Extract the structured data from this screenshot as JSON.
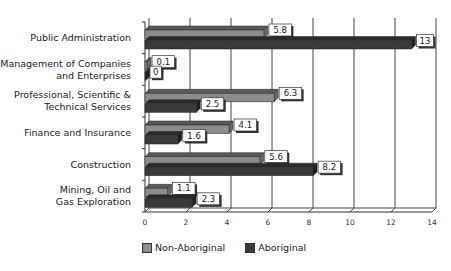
{
  "chart_data": {
    "type": "bar",
    "orientation": "horizontal",
    "style": "3d",
    "title": "",
    "xlabel": "",
    "ylabel": "",
    "xlim": [
      0,
      14
    ],
    "x_ticks": [
      0,
      2,
      4,
      6,
      8,
      10,
      12,
      14
    ],
    "grid": true,
    "legend_position": "bottom",
    "categories": [
      "Public Administration",
      "Management of Companies\nand Enterprises",
      "Professional, Scientific &\nTechnical Services",
      "Finance and Insurance",
      "Construction",
      "Mining, Oil and\nGas Exploration"
    ],
    "series": [
      {
        "name": "Non-Aboriginal",
        "color": "#8c8c8c",
        "values": [
          5.8,
          0.1,
          6.3,
          4.1,
          5.6,
          1.1
        ]
      },
      {
        "name": "Aboriginal",
        "color": "#3a3a3a",
        "values": [
          13,
          0,
          2.5,
          1.6,
          8.2,
          2.3
        ]
      }
    ],
    "data_labels": [
      [
        "5.8",
        "0.1",
        "6.3",
        "4.1",
        "5.6",
        "1.1"
      ],
      [
        "13",
        "0",
        "2.5",
        "1.6",
        "8.2",
        "2.3"
      ]
    ]
  },
  "legend": {
    "items": [
      {
        "label": "Non-Aboriginal",
        "color": "#8c8c8c"
      },
      {
        "label": "Aboriginal",
        "color": "#3a3a3a"
      }
    ]
  }
}
